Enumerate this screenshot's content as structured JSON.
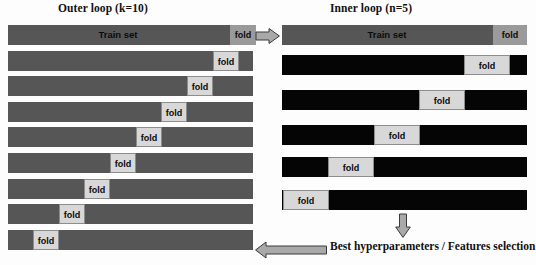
{
  "figure": {
    "type": "diagram",
    "background_color": "#fdfdfd",
    "colors": {
      "train_bar_outer": "#565656",
      "train_bar_inner": "#050505",
      "fold_dark": "#9a9a9a",
      "fold_light": "#d8d8d8",
      "arrow_fill": "#a9a9a9",
      "arrow_stroke": "#3a3a3a",
      "text": "#111111"
    }
  },
  "outer_loop": {
    "title": "Outer loop (k=10)",
    "train_label": "Train set",
    "fold_label": "fold",
    "bar_left": 8,
    "bar_width": 245,
    "row_height": 20,
    "row_pitch": 25.6,
    "first_row_top": 25,
    "rows": [
      {
        "index": 1,
        "fold_left": 222,
        "fold_width": 26,
        "fold_style": "dark",
        "show_train_label": true,
        "train_label_center": 110
      },
      {
        "index": 2,
        "fold_left": 205,
        "fold_width": 26,
        "fold_style": "light",
        "show_train_label": false
      },
      {
        "index": 3,
        "fold_left": 179,
        "fold_width": 26,
        "fold_style": "light",
        "show_train_label": false
      },
      {
        "index": 4,
        "fold_left": 153,
        "fold_width": 26,
        "fold_style": "light",
        "show_train_label": false
      },
      {
        "index": 5,
        "fold_left": 128,
        "fold_width": 26,
        "fold_style": "light",
        "show_train_label": false
      },
      {
        "index": 6,
        "fold_left": 102,
        "fold_width": 26,
        "fold_style": "light",
        "show_train_label": false
      },
      {
        "index": 7,
        "fold_left": 76,
        "fold_width": 26,
        "fold_style": "light",
        "show_train_label": false
      },
      {
        "index": 8,
        "fold_left": 51,
        "fold_width": 26,
        "fold_style": "light",
        "show_train_label": false
      },
      {
        "index": 9,
        "fold_left": 25,
        "fold_width": 26,
        "fold_style": "light",
        "show_train_label": false
      }
    ]
  },
  "inner_loop": {
    "title": "Inner loop (n=5)",
    "train_label": "Train set",
    "fold_label": "fold",
    "bar_left": 282,
    "bar_width": 245,
    "row_height": 20,
    "rows": [
      {
        "index": 0,
        "top": 25,
        "bar_color": "gray",
        "fold_left": 211,
        "fold_width": 34,
        "fold_style": "dark",
        "show_train_label": true,
        "train_label_center": 105
      },
      {
        "index": 1,
        "top": 55,
        "bar_color": "black",
        "fold_left": 182,
        "fold_width": 46,
        "fold_style": "light",
        "show_train_label": false
      },
      {
        "index": 2,
        "top": 90,
        "bar_color": "black",
        "fold_left": 137,
        "fold_width": 46,
        "fold_style": "light",
        "show_train_label": false
      },
      {
        "index": 3,
        "top": 125,
        "bar_color": "black",
        "fold_left": 92,
        "fold_width": 46,
        "fold_style": "light",
        "show_train_label": false
      },
      {
        "index": 4,
        "top": 157,
        "bar_color": "black",
        "fold_left": 46,
        "fold_width": 46,
        "fold_style": "light",
        "show_train_label": false
      },
      {
        "index": 5,
        "top": 190,
        "bar_color": "black",
        "fold_left": 1,
        "fold_width": 46,
        "fold_style": "light",
        "show_train_label": false
      }
    ]
  },
  "arrows": {
    "outer_to_inner": {
      "name": "arrow-outer-to-inner",
      "direction": "right",
      "x": 256,
      "y": 28,
      "width": 22,
      "height": 14
    },
    "inner_to_result": {
      "name": "arrow-inner-to-result",
      "direction": "down",
      "x": 395,
      "y": 214,
      "width": 14,
      "height": 22
    },
    "result_to_outer": {
      "name": "arrow-result-to-outer",
      "direction": "left",
      "x": 255,
      "y": 241,
      "width": 70,
      "height": 16
    }
  },
  "result": {
    "text": "Best hyperparameters / Features selection"
  }
}
